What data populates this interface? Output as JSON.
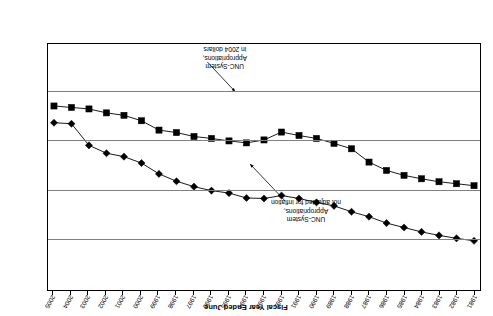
{
  "axes": {
    "x_title": "Fiscal Year Ended June",
    "y_title": "Millions of Dollars",
    "y_ticks": [
      "0",
      "500",
      "1,000",
      "1,500",
      "2,000",
      "2,500"
    ],
    "x_ticks": [
      "1981",
      "1982",
      "1983",
      "1984",
      "1985",
      "1986",
      "1987",
      "1988",
      "1989",
      "1990",
      "1991",
      "1992",
      "1993",
      "1994",
      "1995",
      "1996",
      "1997",
      "1998",
      "1999",
      "2000",
      "2001",
      "2002",
      "2003",
      "2004",
      "2005"
    ]
  },
  "annotations": {
    "nominal": "UNC-System\nAppropriations,\nnot adjusted for inflation",
    "real": "UNC-System\nAppropriations,\nin 2004 dollars"
  },
  "colors": {
    "series_nominal": "#000000",
    "series_real": "#000000",
    "grid": "#808080",
    "frame": "#000000",
    "background": "#ffffff"
  },
  "chart_data": {
    "type": "line",
    "title": "",
    "subtitle": "",
    "xlabel": "Fiscal Year Ended June",
    "ylabel": "Millions of Dollars",
    "ylim": [
      0,
      2500
    ],
    "ytick_values": [
      0,
      500,
      1000,
      1500,
      2000,
      2500
    ],
    "grid": true,
    "legend": "none (inline annotations)",
    "x": [
      1981,
      1982,
      1983,
      1984,
      1985,
      1986,
      1987,
      1988,
      1989,
      1990,
      1991,
      1992,
      1993,
      1994,
      1995,
      1996,
      1997,
      1998,
      1999,
      2000,
      2001,
      2002,
      2003,
      2004,
      2005
    ],
    "series": [
      {
        "name": "UNC-System Appropriations, not adjusted for inflation",
        "marker": "diamond",
        "values": [
          500,
          525,
          555,
          590,
          635,
          680,
          745,
          795,
          855,
          890,
          930,
          960,
          930,
          935,
          985,
          1010,
          1050,
          1105,
          1180,
          1290,
          1355,
          1390,
          1470,
          1690,
          1700
        ]
      },
      {
        "name": "UNC-System Appropriations, in 2004 dollars",
        "marker": "square",
        "values": [
          1060,
          1080,
          1100,
          1130,
          1165,
          1215,
          1300,
          1435,
          1490,
          1540,
          1570,
          1605,
          1525,
          1495,
          1515,
          1540,
          1560,
          1600,
          1625,
          1720,
          1775,
          1800,
          1840,
          1855,
          1870
        ]
      }
    ]
  }
}
